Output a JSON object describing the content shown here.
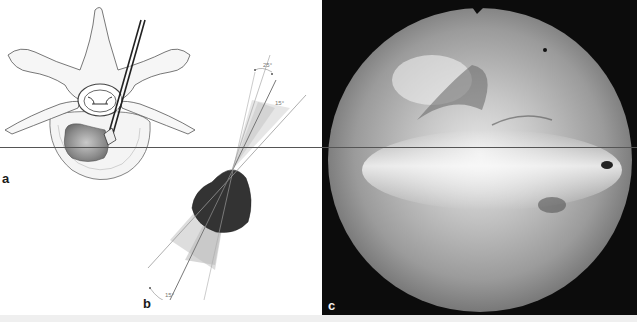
{
  "figure": {
    "panels": [
      {
        "id": "a",
        "label": "a",
        "description": "Axial vertebra illustration with endoscope inserted into disc"
      },
      {
        "id": "b",
        "label": "b",
        "description": "Schematic of endoscope viewing angles through disc"
      },
      {
        "id": "c",
        "label": "c",
        "description": "Circular endoscopic photograph"
      }
    ],
    "angle_labels": {
      "top_outer": "25°",
      "top_inner": "15°",
      "bottom": "15°"
    },
    "colors": {
      "background": "#ffffff",
      "line": "#555555",
      "disc_fill": "#333333",
      "photo_frame": "#0c0c0c"
    }
  }
}
